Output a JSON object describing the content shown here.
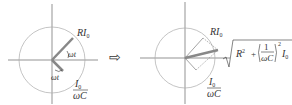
{
  "left_diagram": {
    "vector_label_main": "RI",
    "vector_label_sub": "0",
    "angle_label_1": "ωt",
    "angle_label_2": "ωt",
    "frac_num_main": "I",
    "frac_num_sub": "0",
    "frac_den": "ωC"
  },
  "arrow_symbol": "⇨",
  "right_diagram": {
    "vector_label_main": "RI",
    "vector_label_sub": "0",
    "frac_num_main": "I",
    "frac_num_sub": "0",
    "frac_den": "ωC",
    "result_R": "R",
    "result_R_exp": "2",
    "result_plus": "+",
    "result_one": "1",
    "result_den": "ωC",
    "result_exp": "2",
    "result_I": "I",
    "result_I_sub": "0"
  },
  "colors": {
    "axis": "#666666",
    "circle": "#aaaaaa",
    "vector": "#888888"
  }
}
